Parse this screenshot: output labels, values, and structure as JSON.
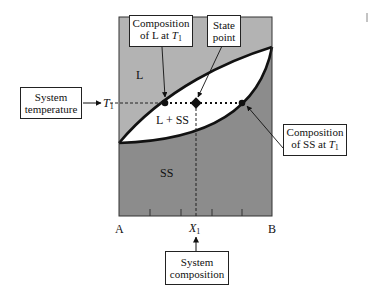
{
  "diagram": {
    "type": "binary isomorphous phase diagram",
    "colors": {
      "liquid_region": "#b3b3b3",
      "solid_region": "#8c8c8c",
      "two_phase_region": "#ffffff",
      "lines": "#111111"
    },
    "regions": {
      "liquid": "L",
      "two_phase": "L + SS",
      "solid": "SS"
    },
    "axis": {
      "left_end": "A",
      "right_end": "B",
      "composition_marker": "X",
      "composition_marker_sub": "1",
      "temperature_marker": "T",
      "temperature_marker_sub": "1"
    },
    "callouts": {
      "system_temperature": {
        "line1": "System",
        "line2": "temperature"
      },
      "composition_L": {
        "line1": "Composition",
        "line2_prefix": "of L at ",
        "line2_var": "T",
        "line2_sub": "1"
      },
      "state_point": {
        "line1": "State",
        "line2": "point"
      },
      "composition_SS": {
        "line1": "Composition",
        "line2_prefix": "of SS at ",
        "line2_var": "T",
        "line2_sub": "1"
      },
      "system_composition": {
        "line1": "System",
        "line2": "composition"
      }
    }
  }
}
